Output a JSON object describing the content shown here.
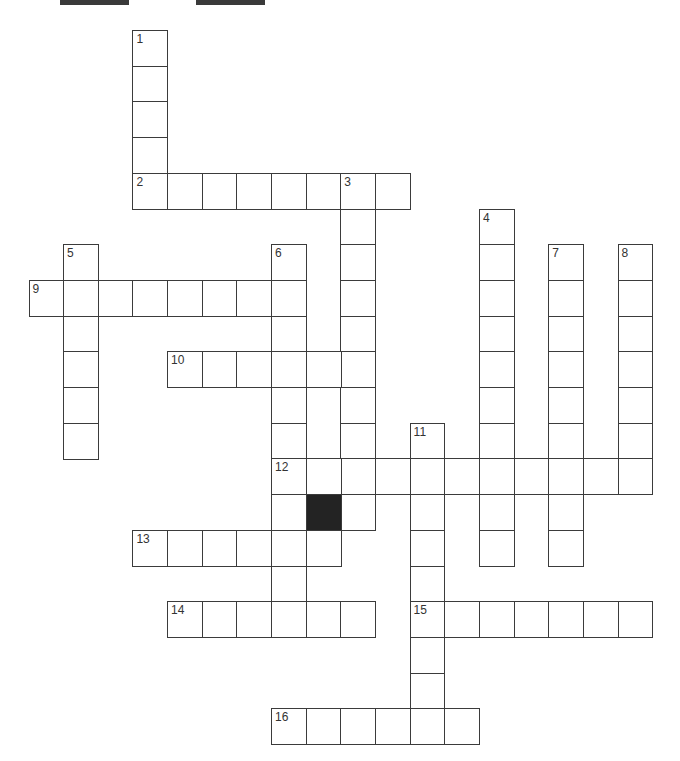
{
  "puzzle": {
    "type": "crossword",
    "grid": {
      "origin_x": 28.5,
      "origin_y": 30,
      "cell_w": 34.65,
      "cell_h": 35.7
    },
    "top_bars": [
      {
        "x": 60,
        "width": 69
      },
      {
        "x": 196,
        "width": 69
      }
    ],
    "entries": [
      {
        "number": "1",
        "direction": "down",
        "row": 0,
        "col": 3,
        "length": 5
      },
      {
        "number": "2",
        "direction": "across",
        "row": 4,
        "col": 3,
        "length": 8
      },
      {
        "number": "3",
        "direction": "down",
        "row": 4,
        "col": 9,
        "length": 10
      },
      {
        "number": "4",
        "direction": "down",
        "row": 5,
        "col": 13,
        "length": 10
      },
      {
        "number": "5",
        "direction": "down",
        "row": 6,
        "col": 1,
        "length": 6
      },
      {
        "number": "6",
        "direction": "down",
        "row": 6,
        "col": 7,
        "length": 11
      },
      {
        "number": "7",
        "direction": "down",
        "row": 6,
        "col": 15,
        "length": 9
      },
      {
        "number": "8",
        "direction": "down",
        "row": 6,
        "col": 17,
        "length": 7
      },
      {
        "number": "9",
        "direction": "across",
        "row": 7,
        "col": 0,
        "length": 8
      },
      {
        "number": "10",
        "direction": "across",
        "row": 9,
        "col": 4,
        "length": 6
      },
      {
        "number": "11",
        "direction": "down",
        "row": 11,
        "col": 11,
        "length": 9
      },
      {
        "number": "12",
        "direction": "across",
        "row": 12,
        "col": 7,
        "length": 11
      },
      {
        "number": "13",
        "direction": "across",
        "row": 14,
        "col": 3,
        "length": 6
      },
      {
        "number": "14",
        "direction": "across",
        "row": 16,
        "col": 4,
        "length": 6
      },
      {
        "number": "15",
        "direction": "across",
        "row": 16,
        "col": 11,
        "length": 7
      },
      {
        "number": "16",
        "direction": "across",
        "row": 19,
        "col": 7,
        "length": 6
      }
    ],
    "black_cells": [
      {
        "row": 13,
        "col": 8
      }
    ]
  }
}
